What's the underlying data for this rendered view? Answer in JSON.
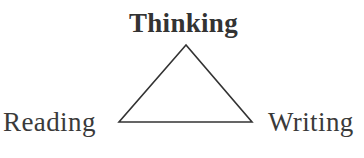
{
  "diagram": {
    "shape": "triangle",
    "stroke_color": "#333333",
    "vertices": {
      "top": {
        "label": "Thinking",
        "emphasis": "bold"
      },
      "bottom_left": {
        "label": "Reading"
      },
      "bottom_right": {
        "label": "Writing"
      }
    }
  }
}
